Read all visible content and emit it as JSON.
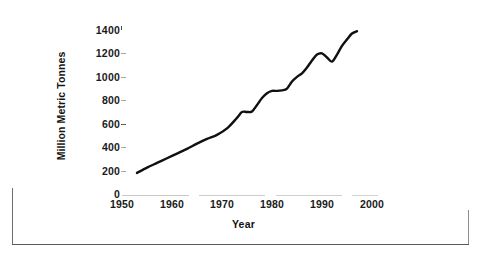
{
  "chart_data": {
    "type": "line",
    "title": "",
    "xlabel": "Year",
    "ylabel": "Million Metric Tonnes",
    "xlim": [
      1950,
      2000
    ],
    "ylim": [
      0,
      1400
    ],
    "xticks": [
      1950,
      1960,
      1970,
      1980,
      1990,
      2000
    ],
    "xtick_labels": [
      "1950",
      "1960",
      "1970",
      "1980",
      "1990",
      "2000"
    ],
    "yticks": [
      0,
      200,
      400,
      600,
      800,
      1000,
      1200,
      1400
    ],
    "ytick_labels": [
      "0",
      "200",
      "400",
      "600",
      "800",
      "1000",
      "1200",
      "1400"
    ],
    "grid": false,
    "legend": false,
    "series": [
      {
        "name": "World production",
        "color": "#101010",
        "x": [
          1953,
          1955,
          1957,
          1959,
          1961,
          1963,
          1965,
          1967,
          1969,
          1971,
          1973,
          1974,
          1975,
          1976,
          1977,
          1978,
          1979,
          1980,
          1981,
          1982,
          1983,
          1984,
          1985,
          1986,
          1987,
          1988,
          1989,
          1990,
          1991,
          1992,
          1993,
          1994,
          1995,
          1996,
          1997
        ],
        "values": [
          180,
          225,
          265,
          305,
          345,
          385,
          430,
          470,
          505,
          560,
          650,
          700,
          700,
          705,
          760,
          820,
          860,
          880,
          880,
          885,
          900,
          960,
          1000,
          1030,
          1080,
          1140,
          1190,
          1200,
          1165,
          1130,
          1190,
          1265,
          1320,
          1370,
          1390
        ]
      }
    ]
  },
  "axis": {
    "y_title": "Million Metric Tonnes",
    "x_title": "Year"
  }
}
